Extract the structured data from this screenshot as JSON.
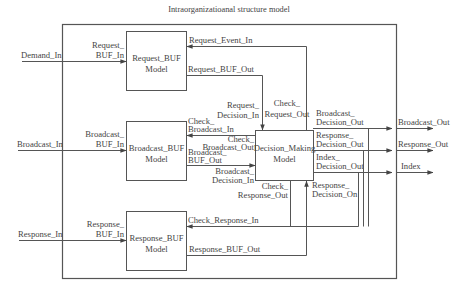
{
  "diagram": {
    "title": "Intraorganizatioanal structure model",
    "colors": {
      "line": "#555555",
      "text": "#444444",
      "background": "#ffffff"
    },
    "blocks": {
      "request_buf": {
        "line1": "Request_BUF",
        "line2": "Model"
      },
      "broadcast_buf": {
        "line1": "Broadcast_BUF",
        "line2": "Model"
      },
      "response_buf": {
        "line1": "Response_BUF",
        "line2": "Model"
      },
      "decision_making": {
        "line1": "Decision_Making",
        "line2": "Model"
      }
    },
    "inputs": {
      "demand_in": "Demand_In",
      "broadcast_in": "Broadcast_In",
      "response_in": "Response_In"
    },
    "outputs": {
      "broadcast_out": "Broadcast_Out",
      "response_out": "Response_Out",
      "index": "Index"
    },
    "ports": {
      "request_buf_in": [
        "Request_",
        "BUF_In"
      ],
      "broadcast_buf_in": [
        "Broadcast_",
        "BUF_In"
      ],
      "response_buf_in": [
        "Response_",
        "BUF_In"
      ],
      "request_event_in": "Request_Event_In",
      "request_buf_out": "Request_BUF_Out",
      "check_broadcast_in": [
        "Check_",
        "Broadcast_In"
      ],
      "broadcast_buf_out": [
        "Broadcast_",
        "BUF_Out"
      ],
      "check_response_in": "Check_Response_In",
      "response_buf_out": "Response_BUF_Out",
      "request_decision_in": [
        "Request_",
        "Decision_In"
      ],
      "check_request_out": [
        "Check_",
        "Request_Out"
      ],
      "check_broadcast_out": [
        "Check_",
        "Broadcast_Out"
      ],
      "broadcast_decision_in": [
        "Broadcast_",
        "Decision_In"
      ],
      "check_response_out": [
        "Check_",
        "Response_Out"
      ],
      "response_decision_on": [
        "Response_",
        "Decision_On"
      ],
      "broadcast_decision_out": [
        "Broadcast_",
        "Decision_Out"
      ],
      "response_decision_out": [
        "Response_",
        "Decision_Out"
      ],
      "index_decision_out": [
        "Index_",
        "Decision_Out"
      ]
    }
  }
}
